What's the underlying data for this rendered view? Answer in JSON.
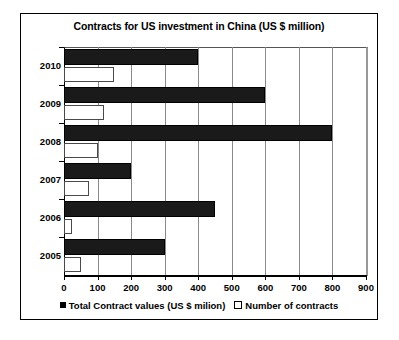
{
  "chart_data": {
    "type": "bar",
    "orientation": "horizontal",
    "title": "Contracts for US investment in China (US $ million)",
    "xlabel": "",
    "ylabel": "",
    "categories": [
      "2010",
      "2009",
      "2008",
      "2007",
      "2006",
      "2005"
    ],
    "series": [
      {
        "name": "Total Contract values (US $ milion)",
        "swatch": "filled",
        "values": [
          400,
          600,
          800,
          200,
          450,
          300
        ]
      },
      {
        "name": "Number of contracts",
        "swatch": "hollow",
        "values": [
          150,
          120,
          100,
          75,
          25,
          50
        ]
      }
    ],
    "xlim": [
      0,
      900
    ],
    "xticks": [
      0,
      100,
      200,
      300,
      400,
      500,
      600,
      700,
      800,
      900
    ],
    "xtick_labels": [
      "0",
      "100",
      "200",
      "300",
      "400",
      "500",
      "600",
      "700",
      "800",
      "900"
    ],
    "grid": "vertical",
    "legend_position": "bottom"
  },
  "legend": {
    "entries": [
      {
        "label": "Total Contract values (US $ milion)"
      },
      {
        "label": "Number of contracts"
      }
    ]
  }
}
